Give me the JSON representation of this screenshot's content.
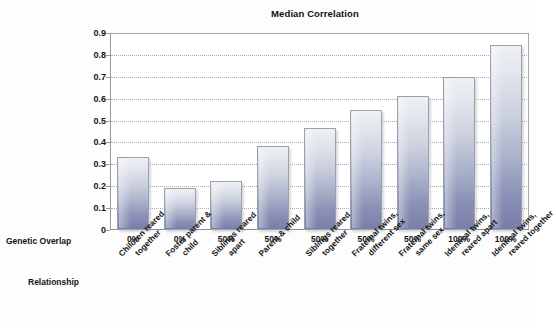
{
  "chart_data": {
    "type": "bar",
    "title": "Median Correlation",
    "xlabel": "",
    "ylabel": "",
    "ylim": [
      0,
      0.9
    ],
    "ytick_labels": [
      "0.9",
      "0.8",
      "0.7",
      "0.6",
      "0.5",
      "0.4",
      "0.3",
      "0.2",
      "0.1",
      "0"
    ],
    "ytick_values": [
      0.9,
      0.8,
      0.7,
      0.6,
      0.5,
      0.4,
      0.3,
      0.2,
      0.1,
      0
    ],
    "grid": true,
    "legend": "none",
    "categories": [
      "Children reared together",
      "Foster parent & child",
      "Siblings reared apart",
      "Parent & child",
      "Siblings reared together",
      "Fraternal twins, different sex",
      "Fraternal twins, same sex",
      "Identical twins, reared apart",
      "Identical twins, reared together"
    ],
    "values": [
      0.335,
      0.19,
      0.225,
      0.385,
      0.465,
      0.55,
      0.61,
      0.7,
      0.845
    ],
    "genetic_overlap": [
      "0%",
      "0%",
      "50%",
      "50%",
      "50%",
      "50%",
      "50%",
      "100%",
      "100%"
    ],
    "category_lines": [
      [
        "Children reared",
        "together"
      ],
      [
        "Foster parent &",
        "child"
      ],
      [
        "Siblings reared",
        "apart"
      ],
      [
        "Parent & child",
        ""
      ],
      [
        "Siblings reared",
        "together"
      ],
      [
        "Fraternal twins,",
        "different sex"
      ],
      [
        "Fraternal twins,",
        "same sex"
      ],
      [
        "Identical twins,",
        "reared apart"
      ],
      [
        "Identical twins,",
        "reared together"
      ]
    ],
    "bar_color_top": "#eef0f4",
    "bar_color_bottom": "#787ea8",
    "bar_border_color": "#9ba0ab",
    "gridline_color": "#9aa0ad"
  },
  "axis_rows": {
    "genetic_overlap_label": "Genetic Overlap",
    "relationship_label": "Relationship"
  }
}
